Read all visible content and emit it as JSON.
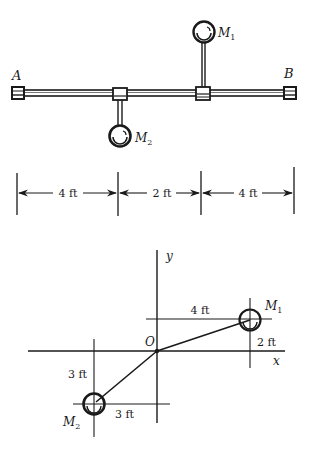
{
  "top_figure": {
    "end_labels": {
      "left": "A",
      "right": "B"
    },
    "masses": [
      {
        "name": "M",
        "sub": "1",
        "side": "up"
      },
      {
        "name": "M",
        "sub": "2",
        "side": "down"
      }
    ]
  },
  "dimensions": {
    "segments": [
      "4 ft",
      "2 ft",
      "4 ft"
    ]
  },
  "bottom_figure": {
    "axes": {
      "x": "x",
      "y": "y",
      "origin": "O"
    },
    "m1": {
      "name": "M",
      "sub": "1",
      "dx_label": "4 ft",
      "dy_label": "2 ft"
    },
    "m2": {
      "name": "M",
      "sub": "2",
      "dx_label": "3 ft",
      "dy_label": "3 ft"
    }
  },
  "colors": {
    "ink": "#1a1a1a",
    "background": "#ffffff"
  }
}
